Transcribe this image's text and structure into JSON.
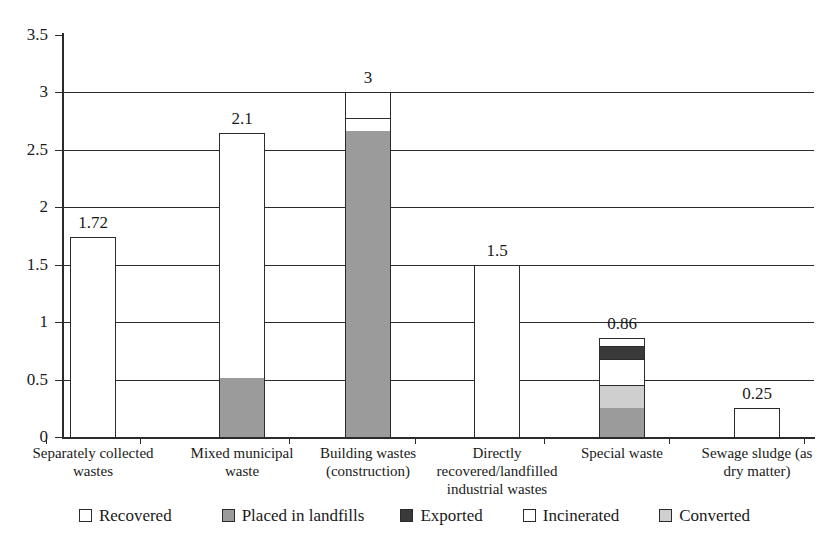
{
  "chart_data": {
    "type": "bar",
    "subtype": "stacked-bar",
    "title": "",
    "subtitle": "",
    "xlabel": "",
    "ylabel": "",
    "ylim": [
      0,
      3.5
    ],
    "yticks": [
      "0",
      "0.5",
      "1",
      "1.5",
      "2",
      "2.5",
      "3",
      "3.5"
    ],
    "ytick_values": [
      0,
      0.5,
      1,
      1.5,
      2,
      2.5,
      3,
      3.5
    ],
    "grid": true,
    "grid_axis": "y",
    "legend_position": "bottom",
    "categories": [
      "Separately collected wastes",
      "Mixed municipal waste",
      "Building wastes (construction)",
      "Directly recovered/landfilled industrial wastes",
      "Special waste",
      "Sewage sludge (as dry matter)"
    ],
    "series": [
      {
        "name": "Recovered",
        "color": "#ffffff",
        "values": [
          1.72,
          2.13,
          0.33,
          1.32,
          0.06,
          0.17
        ]
      },
      {
        "name": "Placed in landfills",
        "color": "#9b9b9b",
        "values": [
          0,
          0.52,
          2.67,
          0,
          0.26,
          0
        ]
      },
      {
        "name": "Exported",
        "color": "#3a3a3a",
        "values": [
          0,
          0,
          0,
          0,
          0.11,
          0
        ]
      },
      {
        "name": "Incinerated",
        "color": "#ffffff",
        "values": [
          0,
          0,
          0,
          0.18,
          0.23,
          0.08
        ]
      },
      {
        "name": "Converted",
        "color": "#cfcfcf",
        "values": [
          0,
          0,
          0,
          0,
          0.2,
          0
        ]
      }
    ],
    "totals": [
      1.72,
      2.65,
      3.0,
      1.5,
      0.86,
      0.25
    ],
    "total_labels": [
      "1.72",
      "2.1",
      "3",
      "1.5",
      "0.86",
      "0.25"
    ],
    "bars": [
      {
        "category": "Separately collected wastes",
        "label_lines": [
          "Separately collected",
          "wastes"
        ],
        "total_label": "1.72",
        "total_value": 1.74,
        "segments": [
          {
            "series": "Recovered",
            "from": 0,
            "to": 1.74,
            "color": "#ffffff"
          }
        ]
      },
      {
        "category": "Mixed municipal waste",
        "label_lines": [
          "Mixed municipal",
          "waste"
        ],
        "total_label": "2.1",
        "total_value": 2.65,
        "segments": [
          {
            "series": "Placed in landfills",
            "from": 0,
            "to": 0.52,
            "color": "#9b9b9b"
          },
          {
            "series": "Recovered",
            "from": 0.52,
            "to": 2.65,
            "color": "#ffffff"
          }
        ]
      },
      {
        "category": "Building wastes (construction)",
        "label_lines": [
          "Building wastes",
          "(construction)"
        ],
        "total_label": "3",
        "total_value": 3.0,
        "segments": [
          {
            "series": "Placed in landfills",
            "from": 0,
            "to": 2.67,
            "color": "#9b9b9b"
          },
          {
            "series": "Incinerated",
            "from": 2.67,
            "to": 2.79,
            "color": "#ffffff"
          },
          {
            "series": "Recovered",
            "from": 2.79,
            "to": 3.0,
            "color": "#ffffff"
          }
        ]
      },
      {
        "category": "Directly recovered/landfilled industrial wastes",
        "label_lines": [
          "Directly",
          "recovered/landfilled",
          "industrial wastes"
        ],
        "total_label": "1.5",
        "total_value": 1.5,
        "segments": [
          {
            "series": "Incinerated",
            "from": 0,
            "to": 0.18,
            "color": "#ffffff"
          },
          {
            "series": "Recovered",
            "from": 0.18,
            "to": 1.5,
            "color": "#ffffff"
          }
        ]
      },
      {
        "category": "Special waste",
        "label_lines": [
          "Special waste"
        ],
        "total_label": "0.86",
        "total_value": 0.86,
        "segments": [
          {
            "series": "Placed in landfills",
            "from": 0,
            "to": 0.26,
            "color": "#9b9b9b"
          },
          {
            "series": "Converted",
            "from": 0.26,
            "to": 0.46,
            "color": "#cfcfcf"
          },
          {
            "series": "Incinerated",
            "from": 0.46,
            "to": 0.69,
            "color": "#ffffff"
          },
          {
            "series": "Exported",
            "from": 0.69,
            "to": 0.8,
            "color": "#3a3a3a"
          },
          {
            "series": "Recovered",
            "from": 0.8,
            "to": 0.86,
            "color": "#ffffff"
          }
        ]
      },
      {
        "category": "Sewage sludge (as dry matter)",
        "label_lines": [
          "Sewage sludge (as",
          "dry matter)"
        ],
        "total_label": "0.25",
        "total_value": 0.25,
        "segments": [
          {
            "series": "Incinerated",
            "from": 0,
            "to": 0.08,
            "color": "#ffffff"
          },
          {
            "series": "Recovered",
            "from": 0.08,
            "to": 0.25,
            "color": "#ffffff"
          }
        ]
      }
    ],
    "legend": [
      {
        "label": "Recovered",
        "color": "#ffffff"
      },
      {
        "label": "Placed in landfills",
        "color": "#9b9b9b"
      },
      {
        "label": "Exported",
        "color": "#3a3a3a"
      },
      {
        "label": "Incinerated",
        "color": "#ffffff"
      },
      {
        "label": "Converted",
        "color": "#cfcfcf"
      }
    ],
    "colors": {
      "axis": "#2b2b2b",
      "grid": "#2b2b2b",
      "text": "#1a1a1a",
      "background": "#ffffff"
    }
  }
}
